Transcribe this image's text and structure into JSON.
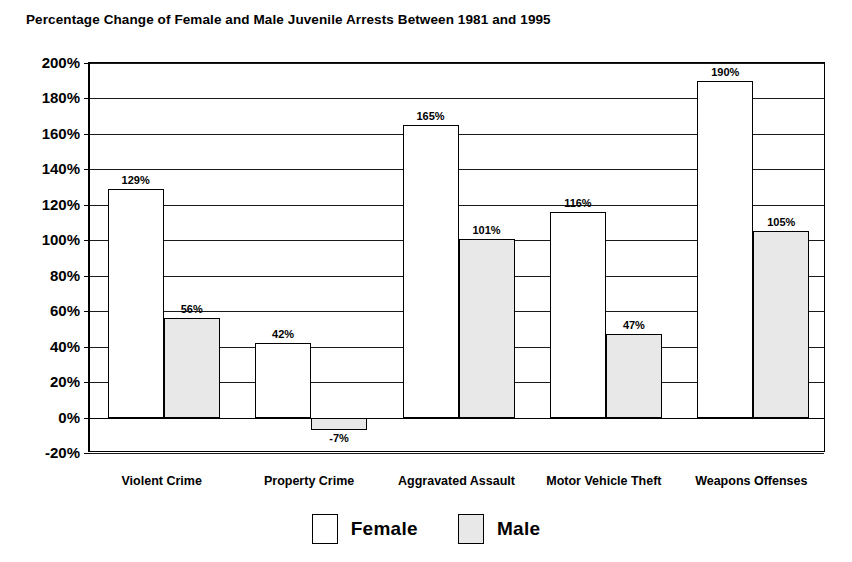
{
  "chart_data": {
    "type": "bar",
    "title": "Percentage Change of Female and Male Juvenile Arrests Between 1981 and 1995",
    "xlabel": "",
    "ylabel": "",
    "ylim": [
      -20,
      200
    ],
    "ytick_step": 20,
    "grid": true,
    "legend_position": "bottom",
    "categories": [
      "Violent Crime",
      "Property Crime",
      "Aggravated Assault",
      "Motor Vehicle Theft",
      "Weapons Offenses"
    ],
    "series": [
      {
        "name": "Female",
        "color": "#ffffff",
        "values": [
          129,
          42,
          165,
          116,
          190
        ],
        "labels": [
          "129%",
          "42%",
          "165%",
          "116%",
          "190%"
        ]
      },
      {
        "name": "Male",
        "color": "#e8e8e8",
        "values": [
          56,
          -7,
          101,
          47,
          105
        ],
        "labels": [
          "56%",
          "-7%",
          "101%",
          "47%",
          "105%"
        ]
      }
    ],
    "ytick_labels": [
      "200%",
      "180%",
      "160%",
      "140%",
      "120%",
      "100%",
      "80%",
      "60%",
      "40%",
      "20%",
      "0%",
      "-20%"
    ],
    "ytick_values": [
      200,
      180,
      160,
      140,
      120,
      100,
      80,
      60,
      40,
      20,
      0,
      -20
    ]
  },
  "legend": {
    "items": [
      {
        "label": "Female",
        "swatch": "white-square-swatch"
      },
      {
        "label": "Male",
        "swatch": "gray-square-swatch"
      }
    ]
  }
}
